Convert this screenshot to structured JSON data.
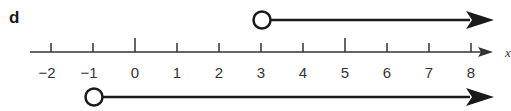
{
  "part_label": "d",
  "axis": {
    "variable": "x",
    "min": -2,
    "max": 8,
    "ticks": [
      "−2",
      "−1",
      "0",
      "1",
      "2",
      "3",
      "4",
      "5",
      "6",
      "7",
      "8"
    ],
    "major_ticks": [
      0,
      5
    ]
  },
  "rays": [
    {
      "name": "ray-top",
      "start": 3,
      "endpoint": "open-circle",
      "direction": "right",
      "inequality": "x > 3"
    },
    {
      "name": "ray-bottom",
      "start": -1,
      "endpoint": "open-circle",
      "direction": "right",
      "inequality": "x > -1"
    }
  ],
  "colors": {
    "line": "#1a1a1a",
    "axis": "#333333",
    "background": "#ffffff"
  }
}
